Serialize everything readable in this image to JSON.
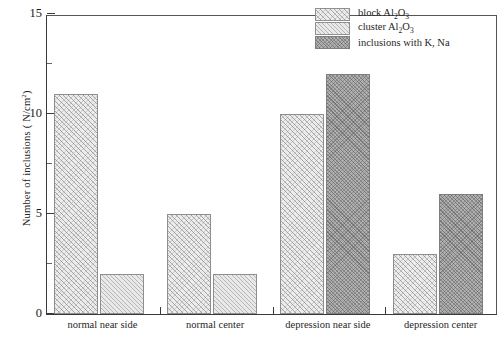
{
  "chart_data": {
    "type": "bar",
    "title": "",
    "xlabel": "",
    "ylabel": "Number of inclusions ( N/cm2)",
    "ylabel_prefix": "Number of inclusions ( N/cm",
    "ylabel_sup": "2",
    "ylabel_suffix": ")",
    "ylim": [
      0,
      15
    ],
    "ytick_labels": [
      "0",
      "5",
      "10",
      "15"
    ],
    "ytick_values": [
      0,
      5,
      10,
      15
    ],
    "yminor_values": [
      2.5,
      7.5,
      12.5
    ],
    "grid": false,
    "legend_position": "top-right",
    "categories": [
      "normal near side",
      "normal center",
      "depression near side",
      "depression center"
    ],
    "series": [
      {
        "name": "block Al2O3",
        "legend_prefix": "block Al",
        "legend_sub1": "2",
        "legend_mid": "O",
        "legend_sub2": "3",
        "color": "#ececec",
        "pattern": "cross-hatch",
        "values": [
          11,
          5,
          10,
          3
        ]
      },
      {
        "name": "cluster Al2O3",
        "legend_prefix": "cluster Al",
        "legend_sub1": "2",
        "legend_mid": "O",
        "legend_sub2": "3",
        "color": "#e9e9e9",
        "pattern": "diagonal-hatch",
        "values": [
          2,
          2,
          null,
          null
        ]
      },
      {
        "name": "inclusions with K, Na",
        "legend_prefix": "inclusions with K, Na",
        "legend_sub1": "",
        "legend_mid": "",
        "legend_sub2": "",
        "color": "#b0b0b0",
        "pattern": "dense-cross-hatch",
        "values": [
          null,
          null,
          12,
          6
        ]
      }
    ]
  },
  "legend": {
    "items": [
      {
        "label_prefix": "block Al",
        "sub1": "2",
        "mid": "O",
        "sub2": "3",
        "swatch": "block"
      },
      {
        "label_prefix": "cluster Al",
        "sub1": "2",
        "mid": "O",
        "sub2": "3",
        "swatch": "cluster"
      },
      {
        "label_prefix": "inclusions with K, Na",
        "sub1": "",
        "mid": "",
        "sub2": "",
        "swatch": "kna"
      }
    ]
  }
}
